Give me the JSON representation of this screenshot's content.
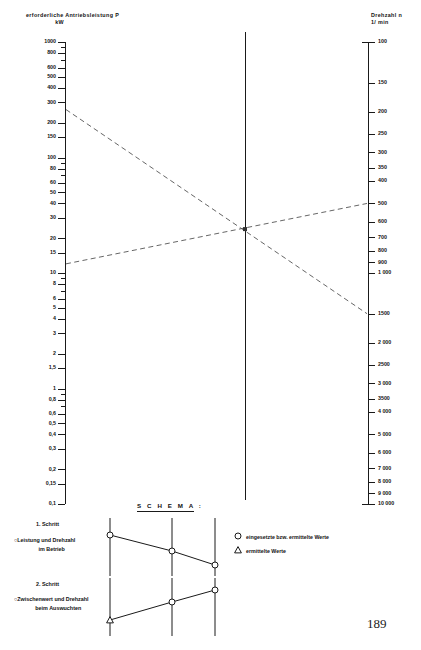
{
  "page": {
    "number": "189",
    "domain_note": "nomogram"
  },
  "axes": {
    "left": {
      "title_line1": "erforderliche Antriebsleistung P",
      "title_line2": "kW",
      "quantity": "erforderliche Antriebsleistung P",
      "unit": "kW",
      "scale": "logarithmic",
      "direction": "decreasing-downward",
      "range": [
        0.1,
        1000
      ],
      "labels": [
        "1000",
        "800",
        "600",
        "500",
        "400",
        "300",
        "200",
        "150",
        "100",
        "80",
        "60",
        "50",
        "40",
        "30",
        "20",
        "15",
        "10",
        "8",
        "6",
        "5",
        "4",
        "3",
        "2",
        "1,5",
        "1",
        "0,8",
        "0,6",
        "0,5",
        "0,4",
        "0,3",
        "0,2",
        "0,15",
        "0,1"
      ],
      "values": [
        1000,
        800,
        600,
        500,
        400,
        300,
        200,
        150,
        100,
        80,
        60,
        50,
        40,
        30,
        20,
        15,
        10,
        8,
        6,
        5,
        4,
        3,
        2,
        1.5,
        1,
        0.8,
        0.6,
        0.5,
        0.4,
        0.3,
        0.2,
        0.15,
        0.1
      ]
    },
    "right": {
      "title_line1": "Drehzahl n",
      "title_line2": "1/ min",
      "quantity": "Drehzahl n",
      "unit": "1/min",
      "scale": "logarithmic",
      "direction": "increasing-downward",
      "range": [
        100,
        10000
      ],
      "labels": [
        "100",
        "150",
        "200",
        "250",
        "300",
        "350",
        "400",
        "500",
        "600",
        "700",
        "800",
        "900",
        "1 000",
        "1500",
        "2 000",
        "2500",
        "3 000",
        "3500",
        "4 000",
        "5 000",
        "6 000",
        "7 000",
        "8 000",
        "9 000",
        "10 000"
      ],
      "values": [
        100,
        150,
        200,
        250,
        300,
        350,
        400,
        500,
        600,
        700,
        800,
        900,
        1000,
        1500,
        2000,
        2500,
        3000,
        3500,
        4000,
        5000,
        6000,
        7000,
        8000,
        9000,
        10000
      ]
    },
    "center": {
      "description": "unbeschriftete Mittelachse"
    }
  },
  "chart_data": {
    "type": "line",
    "subtype": "nomogram",
    "xlabel": "",
    "ylabel": "erforderliche Antriebsleistung P [kW]",
    "y2label": "Drehzahl n [1/min]",
    "grid": false,
    "legend_position": "bottom-right",
    "left_axis": {
      "scale": "log",
      "min": 0.1,
      "max": 1000,
      "unit": "kW"
    },
    "right_axis": {
      "scale": "log",
      "min": 100,
      "max": 10000,
      "unit": "1/min",
      "inverted": true
    },
    "series": [
      {
        "name": "1. Schritt – Leistung und Drehzahl im Betrieb",
        "style": "dashed",
        "marker_left": "circle",
        "marker_right": "circle",
        "left_value_kW": 260,
        "right_value_rpm": 1500,
        "pivot_kW": 24
      },
      {
        "name": "2. Schritt – Zwischenwert und Drehzahl beim Auswuchten",
        "style": "dashed",
        "marker_left": "triangle",
        "marker_right": "circle",
        "left_value_kW": 12,
        "right_value_rpm": 500,
        "pivot_kW": 24
      }
    ],
    "annotations": [
      {
        "text": "Schnittpunkt auf der Mittelachse",
        "left_kW": 24
      }
    ]
  },
  "schema": {
    "title": "S C H E M A :",
    "step1": {
      "title": "1. Schritt",
      "desc_line1": "Leistung und Drehzahl",
      "desc_line2": "im Betrieb",
      "marker": "circle",
      "trend": "fallend"
    },
    "step2": {
      "title": "2. Schritt",
      "desc_line1": "Zwischenwert und Drehzahl",
      "desc_line2": "beim Auswuchten",
      "marker": "circle",
      "trend": "steigend"
    }
  },
  "legend": {
    "item1": {
      "symbol": "circle",
      "label": "eingesetzte bzw. ermittelte Werte"
    },
    "item2": {
      "symbol": "triangle",
      "label": "ermittelte Werte"
    }
  },
  "colors": {
    "ink": "#1a1a1a",
    "line": "#555555",
    "background": "#ffffff"
  }
}
